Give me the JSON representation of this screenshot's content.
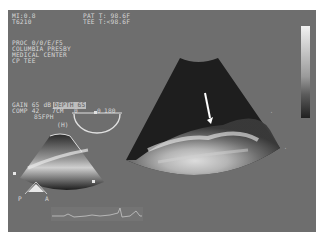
{
  "header": {
    "mi": "MI:0.8",
    "probe": "T6210",
    "pat_temp": "PAT T: 98.6F",
    "tee_temp": "TEE T:<98.6F"
  },
  "institution": {
    "lines": [
      "PROC 0/0/E/F5",
      "COLUMBIA PRESBY",
      "MEDICAL CENTER",
      "CP TEE"
    ]
  },
  "settings": {
    "gain": "GAIN 65 dB",
    "highlighted": "DEPTH 65",
    "comp": "COMP 42",
    "depth_cm": "7CM",
    "fps": "85FPH",
    "harmonic": "(H)"
  },
  "angle_indicator": {
    "left_mark": "0",
    "right_mark": "0",
    "angle": "180"
  },
  "orientation_marker": {
    "labels": [
      "P",
      "A"
    ]
  },
  "grayscale_bar": {
    "top_color": "#f2f2f2",
    "bottom_color": "#202020"
  },
  "colors": {
    "screen_bg": "#6e6e6e",
    "overlay_text": "#d8d8d8",
    "sector_dark": "#1e1e1e"
  }
}
